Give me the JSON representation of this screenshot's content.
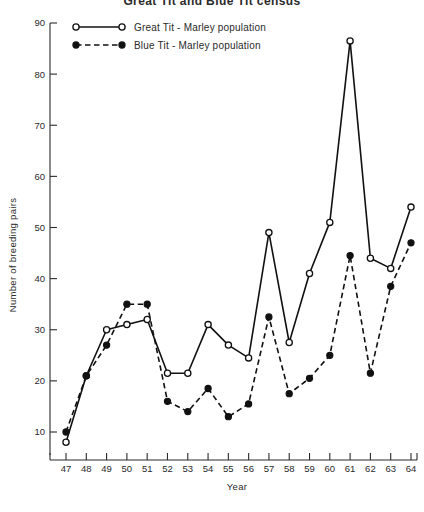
{
  "chart_data": {
    "type": "line",
    "title": "Great Tit and Blue Tit census",
    "xlabel": "Year",
    "ylabel": "Number of breeding pairs",
    "x": [
      47,
      48,
      49,
      50,
      51,
      52,
      53,
      54,
      55,
      56,
      57,
      58,
      59,
      60,
      61,
      62,
      63,
      64
    ],
    "categories": [
      "47",
      "48",
      "49",
      "50",
      "51",
      "52",
      "53",
      "54",
      "55",
      "56",
      "57",
      "58",
      "59",
      "60",
      "61",
      "62",
      "63",
      "64"
    ],
    "xlim": [
      47,
      64
    ],
    "ylim": [
      0,
      90
    ],
    "yticks": [
      10,
      20,
      30,
      40,
      50,
      60,
      70,
      80,
      90
    ],
    "ytick_labels": [
      "10",
      "20",
      "30",
      "40",
      "50",
      "60",
      "70",
      "80",
      "90"
    ],
    "grid": false,
    "legend_position": "top-left",
    "series": [
      {
        "name": "Great Tit - Marley population",
        "marker": "open-circle",
        "linestyle": "solid",
        "color": "#111111",
        "values": [
          8,
          21,
          30,
          31,
          32,
          21.5,
          21.5,
          31,
          27,
          24.5,
          49,
          27.5,
          41,
          51,
          86.5,
          44,
          42,
          54
        ]
      },
      {
        "name": "Blue Tit - Marley population",
        "marker": "filled-circle",
        "linestyle": "dashed",
        "color": "#111111",
        "values": [
          10,
          21,
          27,
          35,
          35,
          16,
          14,
          18.5,
          13,
          15.5,
          32.5,
          17.5,
          20.5,
          25,
          44.5,
          21.5,
          38.5,
          47
        ]
      }
    ]
  },
  "legend": {
    "items": [
      {
        "label": "Great Tit - Marley population",
        "style": "solid-open"
      },
      {
        "label": "Blue Tit - Marley population",
        "style": "dashed-filled"
      }
    ]
  }
}
